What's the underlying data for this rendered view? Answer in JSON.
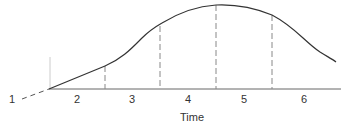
{
  "diagram": {
    "x_axis_label": "Time",
    "stages": [
      {
        "label": "1",
        "x": 12
      },
      {
        "label": "2",
        "x": 77
      },
      {
        "label": "3",
        "x": 132
      },
      {
        "label": "4",
        "x": 188
      },
      {
        "label": "5",
        "x": 244
      },
      {
        "label": "6",
        "x": 304
      }
    ],
    "colors": {
      "line": "#333333",
      "divider": "#888888"
    }
  }
}
